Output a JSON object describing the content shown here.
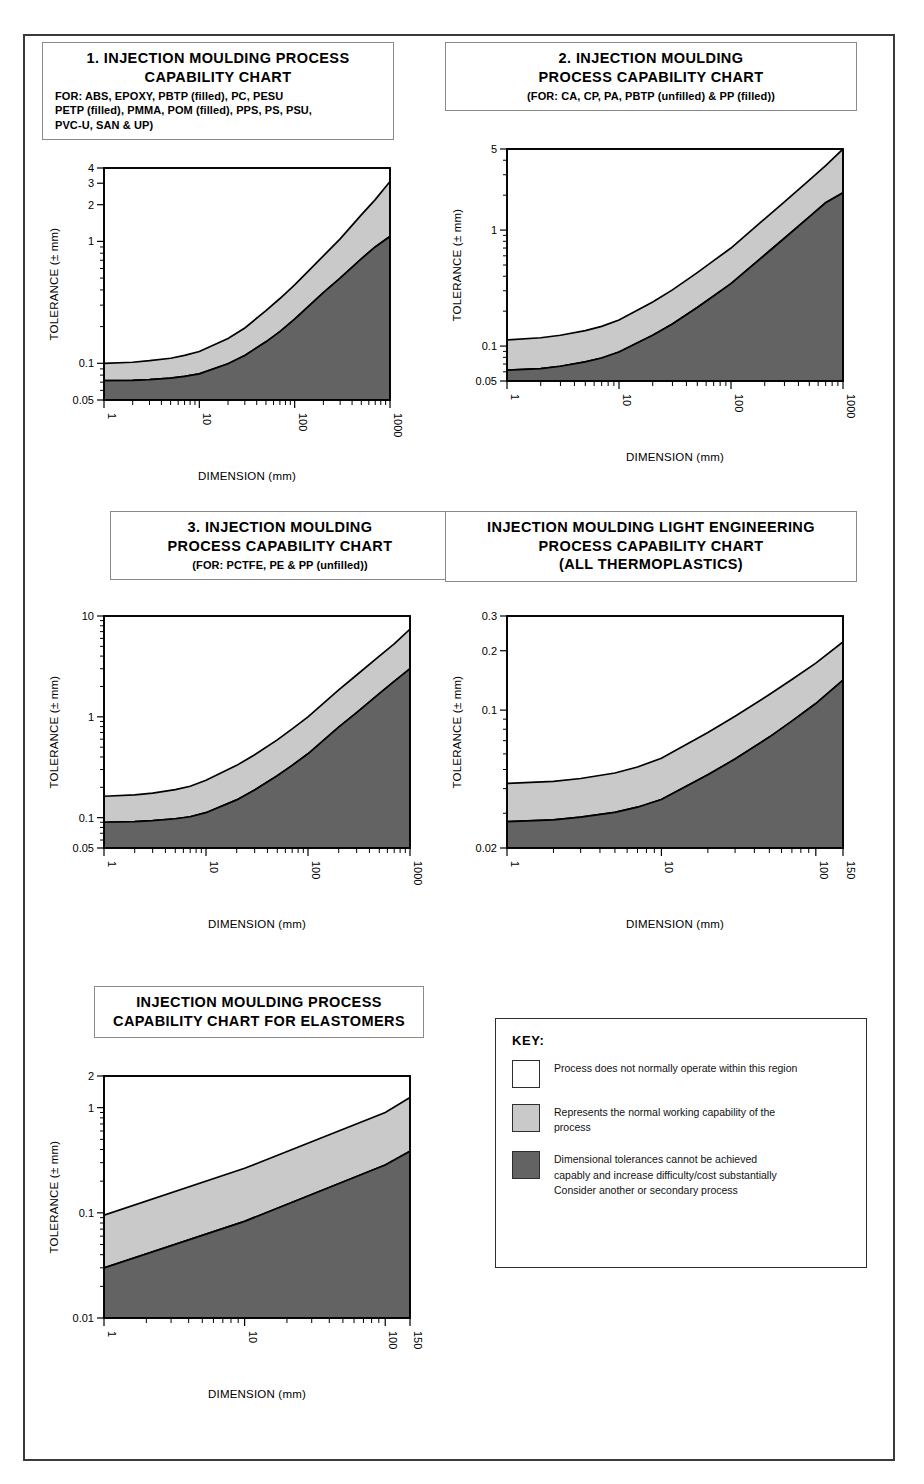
{
  "document": {
    "title": "Injection Moulding Process Capability Charts",
    "axis_titles": {
      "x": "DIMENSION (mm)",
      "y": "TOLERANCE (± mm)"
    }
  },
  "key": {
    "heading": "KEY:",
    "items": [
      {
        "swatch": "white",
        "color": "#ffffff",
        "text": "Process does not normally operate within this region"
      },
      {
        "swatch": "light-gray",
        "color": "#c9c9c9",
        "text": "Represents the normal working capability of the\nprocess"
      },
      {
        "swatch": "dark-gray",
        "color": "#636363",
        "text": "Dimensional tolerances cannot be achieved\ncapably and increase difficulty/cost substantially\nConsider another or secondary process"
      }
    ]
  },
  "chart_data": [
    {
      "id": "chart-1",
      "type": "area",
      "title": "1. INJECTION MOULDING PROCESS\nCAPABILITY CHART",
      "subtitle": "FOR: ABS, EPOXY, PBTP (filled), PC, PESU\nPETP (filled), PMMA, POM (filled), PPS, PS, PSU,\nPVC-U, SAN & UP)",
      "subtitle_align": "left",
      "xlabel": "DIMENSION (mm)",
      "ylabel": "TOLERANCE (± mm)",
      "xscale": "log",
      "yscale": "log",
      "xlim": [
        1,
        1000
      ],
      "ylim": [
        0.05,
        4
      ],
      "xticks": [
        1,
        10,
        100,
        1000
      ],
      "xticklabels": [
        "1",
        "10",
        "100",
        "1000"
      ],
      "yticks": [
        0.05,
        0.1,
        1,
        2,
        3,
        4
      ],
      "yticklabels": [
        "0.05",
        "0.1",
        "1",
        "2",
        "3",
        "4"
      ],
      "grid": false,
      "x": [
        1,
        2,
        3,
        5,
        7,
        10,
        20,
        30,
        50,
        70,
        100,
        200,
        300,
        500,
        700,
        1000
      ],
      "series": [
        {
          "name": "upper boundary (normal capability limit)",
          "values": [
            0.1,
            0.102,
            0.105,
            0.11,
            0.116,
            0.125,
            0.16,
            0.195,
            0.27,
            0.34,
            0.44,
            0.76,
            1.05,
            1.65,
            2.2,
            3.1
          ]
        },
        {
          "name": "lower boundary (difficult/costly limit)",
          "values": [
            0.072,
            0.0725,
            0.0735,
            0.0755,
            0.078,
            0.082,
            0.099,
            0.116,
            0.15,
            0.182,
            0.23,
            0.38,
            0.5,
            0.72,
            0.9,
            1.1
          ]
        }
      ]
    },
    {
      "id": "chart-2",
      "type": "area",
      "title": "2. INJECTION MOULDING\nPROCESS CAPABILITY CHART",
      "subtitle": "(FOR: CA,  CP, PA, PBTP (unfilled)  & PP (filled))",
      "subtitle_align": "center",
      "xlabel": "DIMENSION (mm)",
      "ylabel": "TOLERANCE (± mm)",
      "xscale": "log",
      "yscale": "log",
      "xlim": [
        1,
        1000
      ],
      "ylim": [
        0.05,
        5
      ],
      "xticks": [
        1,
        10,
        100,
        1000
      ],
      "xticklabels": [
        "1",
        "10",
        "100",
        "1000"
      ],
      "yticks": [
        0.05,
        0.1,
        1,
        5
      ],
      "yticklabels": [
        "0.05",
        "0.1",
        "1",
        "5"
      ],
      "grid": false,
      "x": [
        1,
        2,
        3,
        5,
        7,
        10,
        20,
        30,
        50,
        70,
        100,
        200,
        300,
        500,
        700,
        1000
      ],
      "series": [
        {
          "name": "upper boundary (normal capability limit)",
          "values": [
            0.113,
            0.118,
            0.124,
            0.136,
            0.148,
            0.168,
            0.24,
            0.305,
            0.43,
            0.545,
            0.7,
            1.25,
            1.75,
            2.7,
            3.6,
            5.0
          ]
        },
        {
          "name": "lower boundary (difficult/costly limit)",
          "values": [
            0.062,
            0.064,
            0.067,
            0.073,
            0.079,
            0.089,
            0.124,
            0.155,
            0.215,
            0.27,
            0.345,
            0.61,
            0.85,
            1.3,
            1.72,
            2.1
          ]
        }
      ]
    },
    {
      "id": "chart-3",
      "type": "area",
      "title": "3. INJECTION  MOULDING\nPROCESS CAPABILITY CHART",
      "subtitle": "(FOR: PCTFE, PE & PP (unfilled))",
      "subtitle_align": "center",
      "xlabel": "DIMENSION (mm)",
      "ylabel": "TOLERANCE (± mm)",
      "xscale": "log",
      "yscale": "log",
      "xlim": [
        1,
        1000
      ],
      "ylim": [
        0.05,
        10
      ],
      "xticks": [
        1,
        10,
        100,
        1000
      ],
      "xticklabels": [
        "1",
        "10",
        "100",
        "1000"
      ],
      "yticks": [
        0.05,
        0.1,
        1,
        10
      ],
      "yticklabels": [
        "0.05",
        "0.1",
        "1",
        "10"
      ],
      "grid": false,
      "x": [
        1,
        2,
        3,
        5,
        7,
        10,
        20,
        30,
        50,
        70,
        100,
        200,
        300,
        500,
        700,
        1000
      ],
      "series": [
        {
          "name": "upper boundary (normal capability limit)",
          "values": [
            0.163,
            0.168,
            0.175,
            0.19,
            0.205,
            0.235,
            0.33,
            0.42,
            0.59,
            0.76,
            1.0,
            1.85,
            2.6,
            4.0,
            5.3,
            7.4
          ]
        },
        {
          "name": "lower boundary (difficult/costly limit)",
          "values": [
            0.09,
            0.0915,
            0.0935,
            0.0975,
            0.102,
            0.112,
            0.15,
            0.188,
            0.26,
            0.33,
            0.43,
            0.79,
            1.1,
            1.7,
            2.25,
            3.0
          ]
        }
      ]
    },
    {
      "id": "chart-4",
      "type": "area",
      "title": "INJECTION MOULDING LIGHT ENGINEERING\nPROCESS CAPABILITY CHART\n(ALL THERMOPLASTICS)",
      "subtitle": "",
      "subtitle_align": "center",
      "xlabel": "DIMENSION (mm)",
      "ylabel": "TOLERANCE (± mm)",
      "xscale": "log",
      "yscale": "log",
      "xlim": [
        1,
        150
      ],
      "ylim": [
        0.02,
        0.3
      ],
      "xticks": [
        1,
        10,
        100,
        150
      ],
      "xticklabels": [
        "1",
        "10",
        "100",
        "150"
      ],
      "yticks": [
        0.02,
        0.1,
        0.2,
        0.3
      ],
      "yticklabels": [
        "0.02",
        "0.1",
        "0.2",
        "0.3"
      ],
      "grid": false,
      "x": [
        1,
        2,
        3,
        5,
        7,
        10,
        20,
        30,
        50,
        70,
        100,
        150
      ],
      "series": [
        {
          "name": "upper boundary (normal capability limit)",
          "values": [
            0.0425,
            0.0435,
            0.045,
            0.048,
            0.0515,
            0.057,
            0.077,
            0.093,
            0.12,
            0.143,
            0.173,
            0.222
          ]
        },
        {
          "name": "lower boundary (difficult/costly limit)",
          "values": [
            0.0272,
            0.0278,
            0.0287,
            0.0303,
            0.0322,
            0.0352,
            0.047,
            0.0565,
            0.073,
            0.088,
            0.108,
            0.142
          ]
        }
      ]
    },
    {
      "id": "chart-5",
      "type": "area",
      "title": "INJECTION MOULDING PROCESS\nCAPABILITY CHART FOR ELASTOMERS",
      "subtitle": "",
      "subtitle_align": "center",
      "xlabel": "DIMENSION (mm)",
      "ylabel": "TOLERANCE (± mm)",
      "xscale": "log",
      "yscale": "log",
      "xlim": [
        1,
        150
      ],
      "ylim": [
        0.01,
        2
      ],
      "xticks": [
        1,
        10,
        100,
        150
      ],
      "xticklabels": [
        "1",
        "10",
        "100",
        "150"
      ],
      "yticks": [
        0.01,
        0.1,
        1,
        2
      ],
      "yticklabels": [
        "0.01",
        "0.1",
        "1",
        "2"
      ],
      "grid": false,
      "x": [
        1,
        10,
        100,
        150
      ],
      "series": [
        {
          "name": "upper boundary (normal capability limit)",
          "values": [
            0.095,
            0.265,
            0.9,
            1.25
          ]
        },
        {
          "name": "lower boundary (difficult/costly limit)",
          "values": [
            0.03,
            0.083,
            0.285,
            0.385
          ]
        }
      ]
    }
  ]
}
